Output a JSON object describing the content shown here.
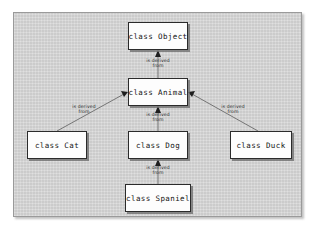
{
  "diagram": {
    "background_color": "#d2d2d2",
    "panel_border_color": "#9a9a9a",
    "node_fill_color": "#fdfdfd",
    "node_border_color": "#2b2b2b",
    "edge_color": "#555555",
    "text_color": "#111111",
    "nodes": [
      {
        "id": "object",
        "label": "class Object"
      },
      {
        "id": "animal",
        "label": "class Animal"
      },
      {
        "id": "cat",
        "label": "class Cat"
      },
      {
        "id": "dog",
        "label": "class Dog"
      },
      {
        "id": "duck",
        "label": "class Duck"
      },
      {
        "id": "spaniel",
        "label": "class Spaniel"
      }
    ],
    "edges": [
      {
        "from": "animal",
        "to": "object",
        "label_line1": "is derived",
        "label_line2": "from",
        "arrow": "triangle-up"
      },
      {
        "from": "cat",
        "to": "animal",
        "label_line1": "is derived",
        "label_line2": "from",
        "arrow": "triangle-up-right"
      },
      {
        "from": "dog",
        "to": "animal",
        "label_line1": "is derived",
        "label_line2": "from",
        "arrow": "triangle-up"
      },
      {
        "from": "duck",
        "to": "animal",
        "label_line1": "is derived",
        "label_line2": "from",
        "arrow": "triangle-up-left"
      },
      {
        "from": "spaniel",
        "to": "dog",
        "label_line1": "is derived",
        "label_line2": "from",
        "arrow": "triangle-up"
      }
    ]
  }
}
